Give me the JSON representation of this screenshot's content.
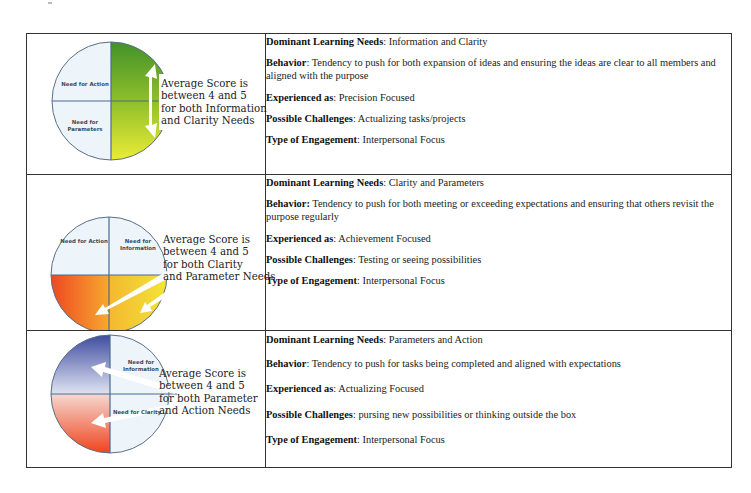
{
  "rows": [
    {
      "visual": {
        "quadrant_labels": [
          "Need for Action",
          "Need for Parameters"
        ],
        "callout": [
          "Average Score is",
          "between 4 and 5",
          "for both Information",
          "and Clarity Needs"
        ],
        "highlight_colors": [
          "#4a9a2a",
          "#e8ea30"
        ]
      },
      "dominant_label": "Dominant Learning Needs",
      "dominant_value": ": Information and Clarity",
      "behavior_label": "Behavior",
      "behavior_value": ": Tendency to push for both expansion of ideas and ensuring the ideas are clear to all members and aligned with the purpose",
      "experienced_label": "Experienced as",
      "experienced_value": ": Precision Focused",
      "challenges_label": "Possible Challenges",
      "challenges_value": ": Actualizing tasks/projects",
      "engagement_label": "Type of Engagement",
      "engagement_value": ": Interpersonal Focus"
    },
    {
      "visual": {
        "quadrant_labels": [
          "Need for Action",
          "Need for Information"
        ],
        "callout": [
          "Average Score is",
          "between 4 and 5",
          "for both Clarity",
          "and Parameter Needs"
        ],
        "highlight_colors": [
          "#ee4a1e",
          "#f2e030"
        ]
      },
      "dominant_label": "Dominant Learning Needs",
      "dominant_value": ": Clarity and Parameters",
      "behavior_label": "Behavior:",
      "behavior_value": " Tendency to push for both meeting or exceeding expectations and ensuring that others revisit the purpose regularly",
      "experienced_label": "Experienced as",
      "experienced_value": ": Achievement Focused",
      "challenges_label": "Possible Challenges",
      "challenges_value": ": Testing or seeing possibilities",
      "engagement_label": "Type of Engagement",
      "engagement_value": ": Interpersonal Focus"
    },
    {
      "visual": {
        "quadrant_labels": [
          "Need for Information",
          "Need for Clarity"
        ],
        "callout": [
          "Average Score is",
          "between 4 and 5",
          "for both Parameter",
          "and Action Needs"
        ],
        "highlight_colors": [
          "#3a4a9a",
          "#ee3a14"
        ]
      },
      "dominant_label": "Dominant Learning Needs",
      "dominant_value": ": Parameters and Action",
      "behavior_label": "Behavior",
      "behavior_value": ": Tendency to push for tasks being completed and aligned with expectations",
      "experienced_label": "Experienced as",
      "experienced_value": ": Actualizing Focused",
      "challenges_label": "Possible Challenges",
      "challenges_value": ": pursing new possibilities or thinking outside the box",
      "engagement_label": "Type of Engagement",
      "engagement_value": ": Interpersonal Focus"
    }
  ]
}
